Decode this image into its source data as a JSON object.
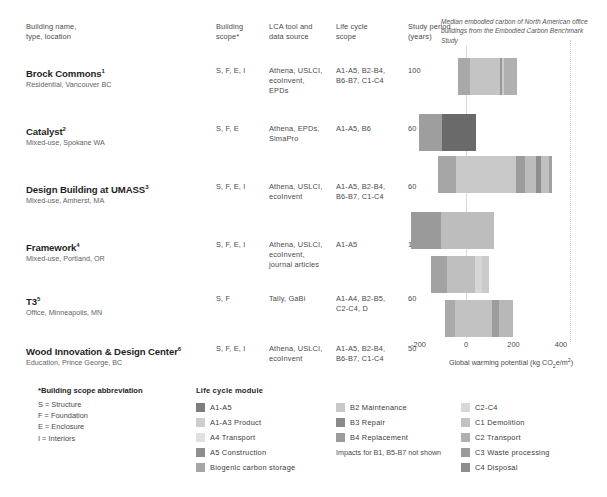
{
  "table": {
    "headers": {
      "name": "Building name,\ntype, location",
      "scope": "Building\nscope*",
      "tool": "LCA tool and\ndata source",
      "lifecycle": "Life cycle\nscope",
      "study": "Study period\n(years)"
    },
    "rows": [
      {
        "name": "Brock Commons",
        "footnote": "1",
        "sub": "Residential, Vancouver BC",
        "scope": "S, F, E, I",
        "tool": "Athena, USLCI,\necoInvent,\nEPDs",
        "lifecycle": "A1-A5, B2-B4,\nB6-B7, C1-C4",
        "study": "100"
      },
      {
        "name": "Catalyst",
        "footnote": "2",
        "sub": "Mixed-use, Spokane WA",
        "scope": "S, F, E",
        "tool": "Athena, EPDs,\nSimaPro",
        "lifecycle": "A1-A5, B6",
        "study": "60"
      },
      {
        "name": "Design Building at UMASS",
        "footnote": "3",
        "sub": "Mixed-use, Amherst, MA",
        "scope": "S, F, E, I",
        "tool": "Athena, USLCI,\necoInvent",
        "lifecycle": "A1-A5, B2-B4,\nB6-B7, C1-C4",
        "study": "60"
      },
      {
        "name": "Framework",
        "footnote": "4",
        "sub": "Mixed-use, Portland, OR",
        "scope": "S, F, E, I",
        "tool": "Athena, USLCI,\necoInvent,\njournal articles",
        "lifecycle": "A1-A5",
        "study": "100"
      },
      {
        "name": "T3",
        "footnote": "5",
        "sub": "Office, Minneapolis, MN",
        "scope": "S, F",
        "tool": "Tally, GaBi",
        "lifecycle": "A1-A4, B2-B5,\nC2-C4, D",
        "study": "60"
      },
      {
        "name": "Wood Innovation & Design Center",
        "footnote": "6",
        "sub": "Education, Prince George, BC",
        "scope": "S, F, E, I",
        "tool": "Athena, USLCI,\necoInvent",
        "lifecycle": "A1-A5, B2-B4,\nB6-B7, C1-C4",
        "study": "50"
      }
    ]
  },
  "chart_data": {
    "type": "bar",
    "orientation": "horizontal",
    "stacked": true,
    "title": "",
    "annotation": "Median embodied carbon of North American office buildings from the Embodied Carbon Benchmark Study",
    "xlabel": "Global warming potential (kg CO2e/m2)",
    "xlabel_parts": {
      "pre": "Global warming potential (kg CO",
      "sub": "2",
      "mid": "e/m",
      "sup": "2",
      "post": ")"
    },
    "ylabel": "",
    "grid": false,
    "xlim": [
      -260,
      500
    ],
    "xticks": [
      -200,
      0,
      200,
      400
    ],
    "xticklabels": [
      "-200",
      "0",
      "200",
      "400"
    ],
    "benchmark_line": 437,
    "zero_line": 0,
    "categories": [
      "Brock Commons",
      "Catalyst",
      "Design Building at UMASS",
      "Framework",
      "T3",
      "Wood Innovation & Design Center"
    ],
    "series": [
      {
        "name": "Brock Commons",
        "segments": [
          {
            "module": "A1-A3 Product",
            "start": -32,
            "value": 48,
            "color": "#a8a8a8"
          },
          {
            "module": "A4 Transport",
            "start": 16,
            "value": 126,
            "color": "#c4c4c4"
          },
          {
            "module": "A5 Construction",
            "start": 142,
            "value": 10,
            "color": "#989898"
          },
          {
            "module": "B2 Maintenance",
            "start": 152,
            "value": 8,
            "color": "#cccccc"
          },
          {
            "module": "C2-C4",
            "start": 160,
            "value": 56,
            "color": "#b0b0b0"
          }
        ],
        "total": 216
      },
      {
        "name": "Catalyst",
        "segments": [
          {
            "module": "A1-A3 Product",
            "start": -200,
            "value": 98,
            "color": "#9e9e9e"
          },
          {
            "module": "A1-A5",
            "start": -102,
            "value": 146,
            "color": "#6a6a6a"
          }
        ],
        "total": 44
      },
      {
        "name": "Design Building at UMASS",
        "segments": [
          {
            "module": "A1-A3 Product",
            "start": -120,
            "value": 78,
            "color": "#a5a5a5"
          },
          {
            "module": "A4 Transport",
            "start": -42,
            "value": 252,
            "color": "#c8c8c8"
          },
          {
            "module": "A5 Construction",
            "start": 210,
            "value": 38,
            "color": "#9c9c9c"
          },
          {
            "module": "B2 Maintenance",
            "start": 248,
            "value": 46,
            "color": "#bcbcbc"
          },
          {
            "module": "B3 Repair",
            "start": 294,
            "value": 22,
            "color": "#8e8e8e"
          },
          {
            "module": "C2-C4",
            "start": 316,
            "value": 34,
            "color": "#c0c0c0"
          },
          {
            "module": "C4 Disposal",
            "start": 350,
            "value": 14,
            "color": "#a0a0a0"
          }
        ],
        "total": 364
      },
      {
        "name": "Framework",
        "segments": [
          {
            "module": "Biogenic carbon storage",
            "start": -232,
            "value": 126,
            "color": "#9a9a9a"
          },
          {
            "module": "A1-A5",
            "start": -106,
            "value": 222,
            "color": "#bdbdbd"
          }
        ],
        "total": 116
      },
      {
        "name": "T3",
        "segments": [
          {
            "module": "A1-A3 Product",
            "start": -148,
            "value": 66,
            "color": "#a2a2a2"
          },
          {
            "module": "A4 Transport",
            "start": -82,
            "value": 122,
            "color": "#bebebe"
          },
          {
            "module": "C2-C4",
            "start": 40,
            "value": 26,
            "color": "#d6d6d6"
          },
          {
            "module": "C3 Waste processing",
            "start": 66,
            "value": 30,
            "color": "#cacaca"
          }
        ],
        "total": 96
      },
      {
        "name": "Wood Innovation & Design Center",
        "segments": [
          {
            "module": "A1-A3 Product",
            "start": -90,
            "value": 42,
            "color": "#aaaaaa"
          },
          {
            "module": "A4 Transport",
            "start": -48,
            "value": 158,
            "color": "#c2c2c2"
          },
          {
            "module": "B4 Replacement",
            "start": 110,
            "value": 30,
            "color": "#9d9d9d"
          },
          {
            "module": "C2-C4",
            "start": 140,
            "value": 58,
            "color": "#b8b8b8"
          }
        ],
        "total": 198
      }
    ]
  },
  "footer": {
    "scope": {
      "title": "*Building scope abbreviation",
      "lines": [
        "S = Structure",
        "F = Foundation",
        "E = Enclosure",
        "I = Interiors"
      ]
    },
    "lifecycle": {
      "title": "Life cycle module",
      "col1": [
        {
          "label": "A1-A5",
          "color": "#7d7d7d"
        },
        {
          "label": "A1-A3 Product",
          "color": "#cdcdcd"
        },
        {
          "label": "A4 Transport",
          "color": "#e0e0e0"
        },
        {
          "label": "A5 Construction",
          "color": "#8e8e8e"
        },
        {
          "label": "Biogenic carbon storage",
          "color": "#a6a6a6"
        }
      ],
      "col2": [
        {
          "label": "B2 Maintenance",
          "color": "#c8c8c8"
        },
        {
          "label": "B3 Repair",
          "color": "#8a8a8a"
        },
        {
          "label": "B4 Replacement",
          "color": "#9b9b9b"
        }
      ],
      "col2_note": "Impacts for B1, B5-B7 not shown",
      "col3": [
        {
          "label": "C2-C4",
          "color": "#d8d8d8"
        },
        {
          "label": "C1 Demolition",
          "color": "#c2c2c2"
        },
        {
          "label": "C2 Transport",
          "color": "#b0b0b0"
        },
        {
          "label": "C3 Waste processing",
          "color": "#9a9a9a"
        },
        {
          "label": "C4 Disposal",
          "color": "#8d8d8d"
        }
      ]
    }
  }
}
